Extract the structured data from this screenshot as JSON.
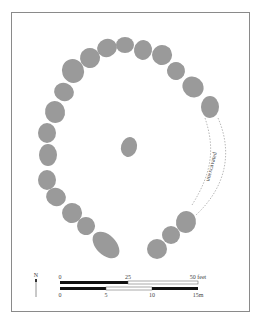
{
  "diagram": {
    "type": "site-plan",
    "annotation": "unexcavated",
    "north_label": "N",
    "scale_feet": {
      "ticks": [
        "0",
        "25",
        "50 feet"
      ]
    },
    "scale_meters": {
      "ticks": [
        "0",
        "5",
        "10",
        "15m"
      ]
    },
    "colors": {
      "stone": "#9a9a9a",
      "frame": "#8a8a8a",
      "bar": "#111111"
    },
    "stones": [
      {
        "x": 73,
        "y": 71,
        "rx": 11,
        "ry": 12,
        "rot": -20
      },
      {
        "x": 90,
        "y": 58,
        "rx": 10,
        "ry": 10,
        "rot": -30
      },
      {
        "x": 107,
        "y": 48,
        "rx": 10,
        "ry": 9,
        "rot": -20
      },
      {
        "x": 125,
        "y": 45,
        "rx": 9,
        "ry": 8,
        "rot": 0
      },
      {
        "x": 143,
        "y": 50,
        "rx": 9,
        "ry": 10,
        "rot": 10
      },
      {
        "x": 162,
        "y": 55,
        "rx": 10,
        "ry": 10,
        "rot": 20
      },
      {
        "x": 176,
        "y": 71,
        "rx": 9,
        "ry": 9,
        "rot": 30
      },
      {
        "x": 193,
        "y": 87,
        "rx": 11,
        "ry": 10,
        "rot": 40
      },
      {
        "x": 210,
        "y": 107,
        "rx": 9,
        "ry": 11,
        "rot": 0
      },
      {
        "x": 64,
        "y": 92,
        "rx": 10,
        "ry": 9,
        "rot": 20
      },
      {
        "x": 55,
        "y": 112,
        "rx": 10,
        "ry": 11,
        "rot": -10
      },
      {
        "x": 47,
        "y": 133,
        "rx": 9,
        "ry": 10,
        "rot": 0
      },
      {
        "x": 48,
        "y": 155,
        "rx": 9,
        "ry": 11,
        "rot": 0
      },
      {
        "x": 47,
        "y": 180,
        "rx": 9,
        "ry": 10,
        "rot": 0
      },
      {
        "x": 56,
        "y": 197,
        "rx": 10,
        "ry": 9,
        "rot": 20
      },
      {
        "x": 72,
        "y": 213,
        "rx": 10,
        "ry": 10,
        "rot": 20
      },
      {
        "x": 86,
        "y": 226,
        "rx": 9,
        "ry": 9,
        "rot": 20
      },
      {
        "x": 106,
        "y": 245,
        "rx": 16,
        "ry": 10,
        "rot": 45
      },
      {
        "x": 186,
        "y": 222,
        "rx": 10,
        "ry": 11,
        "rot": 10
      },
      {
        "x": 171,
        "y": 235,
        "rx": 9,
        "ry": 9,
        "rot": 0
      },
      {
        "x": 157,
        "y": 249,
        "rx": 10,
        "ry": 10,
        "rot": 0
      },
      {
        "x": 129,
        "y": 147,
        "rx": 8,
        "ry": 10,
        "rot": 15
      }
    ]
  }
}
